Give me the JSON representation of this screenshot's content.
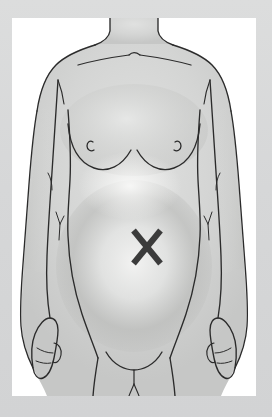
{
  "illustration": {
    "title": "Female torso front view with abdominal marker",
    "subject": "female-torso-anterior",
    "marker_label": "X",
    "marker_meaning": "pain-location-marker",
    "marker_region": "central abdomen / periumbilical",
    "view": "anterior",
    "caption": "",
    "frame": {
      "mat_color": "#d6d7d8",
      "paper_color": "#ffffff",
      "mat_left": 12,
      "mat_top": 18,
      "paper_width": 244,
      "paper_height": 378
    },
    "colors": {
      "mat": "#d6d7d8",
      "paper": "#ffffff",
      "skin_fill": "#d2d3d2",
      "outline": "#2b2b2b",
      "detail_line": "#3a3a3a",
      "shadow": "#a9aaa8",
      "highlight": "#f2f2f1",
      "marker": "#3b3b3b"
    },
    "marker": {
      "center_x": 135,
      "center_y": 229,
      "width": 27,
      "height": 33,
      "stroke_width": 6
    },
    "body_parts": [
      {
        "name": "neck",
        "label": "Neck"
      },
      {
        "name": "clavicle-left",
        "label": "Left clavicle"
      },
      {
        "name": "clavicle-right",
        "label": "Right clavicle"
      },
      {
        "name": "shoulder-left",
        "label": "Left shoulder"
      },
      {
        "name": "shoulder-right",
        "label": "Right shoulder"
      },
      {
        "name": "breast-left",
        "label": "Left breast"
      },
      {
        "name": "breast-right",
        "label": "Right breast"
      },
      {
        "name": "nipple-left",
        "label": "Left nipple"
      },
      {
        "name": "nipple-right",
        "label": "Right nipple"
      },
      {
        "name": "abdomen",
        "label": "Abdomen"
      },
      {
        "name": "umbilicus-region",
        "label": "Periumbilical region"
      },
      {
        "name": "arm-left",
        "label": "Left arm"
      },
      {
        "name": "arm-right",
        "label": "Right arm"
      },
      {
        "name": "hand-left",
        "label": "Left hand"
      },
      {
        "name": "hand-right",
        "label": "Right hand"
      },
      {
        "name": "hip-left",
        "label": "Left hip"
      },
      {
        "name": "hip-right",
        "label": "Right hip"
      },
      {
        "name": "pubic-region",
        "label": "Pubic region"
      },
      {
        "name": "thigh-left",
        "label": "Left thigh"
      },
      {
        "name": "thigh-right",
        "label": "Right thigh"
      }
    ]
  }
}
